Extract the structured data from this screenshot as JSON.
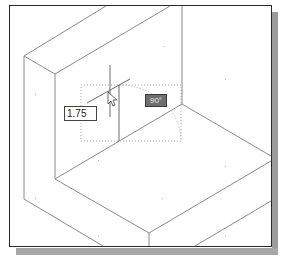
{
  "viewport": {
    "dimension_input": {
      "value": "1.75"
    },
    "angle_tooltip": {
      "label": "90°"
    }
  },
  "colors": {
    "frame": "#2a2a2a",
    "model_edges": "#8a8a8a",
    "tracking": "#b0b0b0",
    "angle_badge_bg": "#6f6f6f",
    "shadow": "#a0a0a0"
  }
}
